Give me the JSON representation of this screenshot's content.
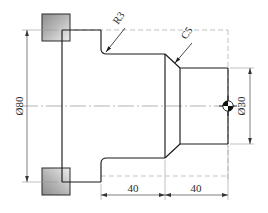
{
  "drawing": {
    "type": "mechanical-part-orthographic-view",
    "description": "Stepped shaft with flange, turned part technical drawing",
    "background_color": "#ffffff",
    "line_color": "#1a1a1a",
    "dim_line_color": "#555555",
    "center_line_color": "#999999",
    "hidden_line_color": "#9a9a9a",
    "hatch_fill_start": "#9d9d9d",
    "hatch_fill_end": "#e8e8e8"
  },
  "dimensions": {
    "diameter_major": {
      "label": "Ø80",
      "value": 80,
      "symbol": "Ø",
      "orientation": "vertical",
      "position": "left"
    },
    "diameter_minor": {
      "label": "Ø30",
      "value": 30,
      "symbol": "Ø",
      "orientation": "vertical",
      "position": "right"
    },
    "length_first": {
      "label": "40",
      "value": 40,
      "orientation": "horizontal",
      "position": "bottom-left"
    },
    "length_second": {
      "label": "40",
      "value": 40,
      "orientation": "horizontal",
      "position": "bottom-right"
    }
  },
  "callouts": {
    "fillet": {
      "label": "R3",
      "value": 3,
      "type": "radius",
      "rotation": -55
    },
    "chamfer": {
      "label": "C5",
      "value": 5,
      "type": "chamfer",
      "rotation": -55
    }
  },
  "markers": {
    "center_mark": {
      "name": "quadrant-center-mark",
      "visible": true
    }
  }
}
